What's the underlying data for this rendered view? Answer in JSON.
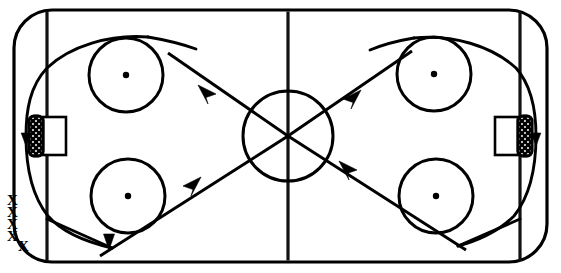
{
  "diagram": {
    "type": "ice-hockey-rink-drill",
    "title": "",
    "canvas": {
      "width": 561,
      "height": 273
    },
    "colors": {
      "ink": "#000000",
      "line": "#111111",
      "ice": "#ffffff"
    }
  },
  "rink": {
    "name": "rink-surface",
    "outline": {
      "x": 14,
      "y": 10,
      "width": 533,
      "height": 252,
      "corner_radius": 38,
      "stroke_width": 3.2
    },
    "lines": [
      {
        "name": "left-blue-line",
        "x": 47,
        "orientation": "vertical"
      },
      {
        "name": "center-red-line",
        "x": 288,
        "orientation": "vertical"
      },
      {
        "name": "right-blue-line",
        "x": 520,
        "orientation": "vertical"
      }
    ],
    "center_circle": {
      "cx": 288,
      "cy": 136,
      "r": 45
    },
    "faceoff_circles": [
      {
        "name": "faceoff-circle-top-left",
        "cx": 126,
        "cy": 75,
        "r": 37,
        "dot_r": 3.2
      },
      {
        "name": "faceoff-circle-bottom-left",
        "cx": 128,
        "cy": 196,
        "r": 37,
        "dot_r": 3.2
      },
      {
        "name": "faceoff-circle-top-right",
        "cx": 434,
        "cy": 74,
        "r": 37,
        "dot_r": 3.2
      },
      {
        "name": "faceoff-circle-bottom-right",
        "cx": 436,
        "cy": 196,
        "r": 37,
        "dot_r": 3.2
      }
    ],
    "goals": [
      {
        "name": "goal-left",
        "net": {
          "x": 29,
          "y": 116,
          "width": 14,
          "height": 40,
          "radius": 5
        },
        "crease": {
          "x": 43,
          "y": 117,
          "width": 23,
          "height": 38
        }
      },
      {
        "name": "goal-right",
        "net": {
          "x": 518,
          "y": 116,
          "width": 14,
          "height": 40,
          "radius": 5
        },
        "crease": {
          "x": 495,
          "y": 117,
          "width": 23,
          "height": 38
        }
      }
    ]
  },
  "players": {
    "label": "X",
    "group_name": "player-queue-bottom-left",
    "marks": [
      {
        "x": 12,
        "y": 204
      },
      {
        "x": 12,
        "y": 216
      },
      {
        "x": 12,
        "y": 228
      },
      {
        "x": 12,
        "y": 240
      },
      {
        "x": 23,
        "y": 250
      }
    ]
  },
  "markers": {
    "cone": {
      "name": "cone-marker",
      "x": 109,
      "y": 236,
      "width": 13,
      "height": 14
    }
  },
  "paths": {
    "pass_lines": [
      {
        "name": "pass-line-up-left",
        "from": {
          "x": 288,
          "y": 136
        },
        "to": {
          "x": 168,
          "y": 53
        },
        "arrow_at": {
          "x": 207,
          "y": 92
        },
        "arrow_angle": 215
      },
      {
        "name": "pass-line-up-right",
        "from": {
          "x": 288,
          "y": 136
        },
        "to": {
          "x": 410,
          "y": 52
        },
        "arrow_at": {
          "x": 352,
          "y": 97
        },
        "arrow_angle": 325
      },
      {
        "name": "pass-line-lower-left",
        "from": {
          "x": 288,
          "y": 136
        },
        "to": {
          "x": 108,
          "y": 254
        },
        "arrow_at": {
          "x": 192,
          "y": 184
        },
        "arrow_angle": 325
      },
      {
        "name": "pass-line-lower-right",
        "from": {
          "x": 288,
          "y": 136
        },
        "to": {
          "x": 463,
          "y": 250
        },
        "arrow_at": {
          "x": 350,
          "y": 168
        },
        "arrow_angle": 212
      }
    ],
    "skate_routes": [
      {
        "name": "skate-route-left-loop",
        "direction": "counter-clockwise",
        "arrow_at": {
          "x": 23,
          "y": 124
        }
      },
      {
        "name": "skate-route-right-loop",
        "direction": "clockwise",
        "arrow_at": {
          "x": 538,
          "y": 124
        }
      }
    ]
  }
}
